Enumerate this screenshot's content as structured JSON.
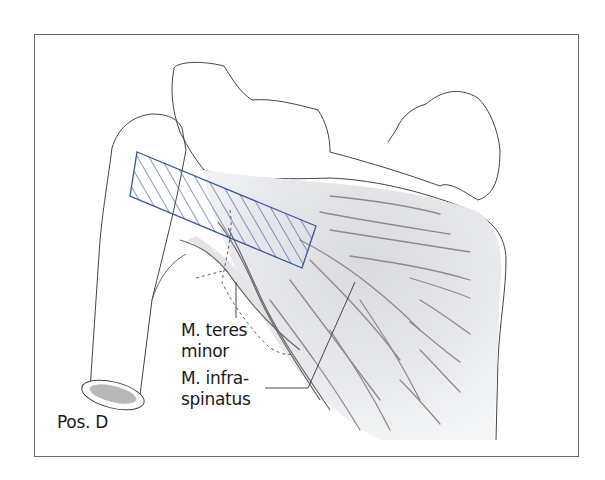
{
  "figure": {
    "position_label": "Pos. D",
    "hatch_color": "#3a55a0",
    "outline_color": "#444444",
    "muscle_fill": "#e9ebee",
    "fiber_color": "#8a8a8a",
    "labels": {
      "teres_minor": {
        "line1": "M. teres",
        "line2": "minor"
      },
      "infraspinatus": {
        "line1": "M. infra-",
        "line2": "spinatus"
      }
    }
  }
}
